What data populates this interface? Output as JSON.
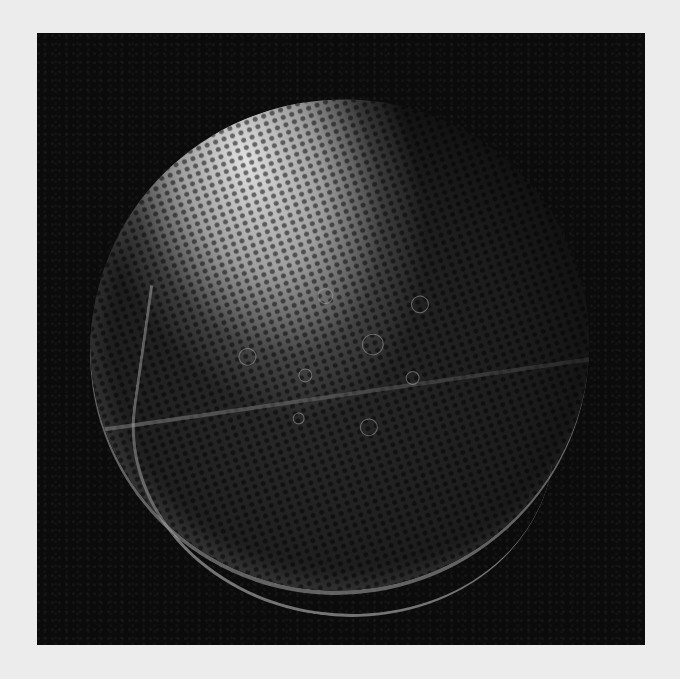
{
  "image": {
    "subject": "moon",
    "description": "Grayscale photograph of a cratered moon with a bright speckled upper region against a black background",
    "colors": {
      "page_background": "#ececec",
      "frame_background": "#0b0b0b",
      "bright_region": "#e6e6e6",
      "dark_surface": "#1c1c1c"
    }
  }
}
